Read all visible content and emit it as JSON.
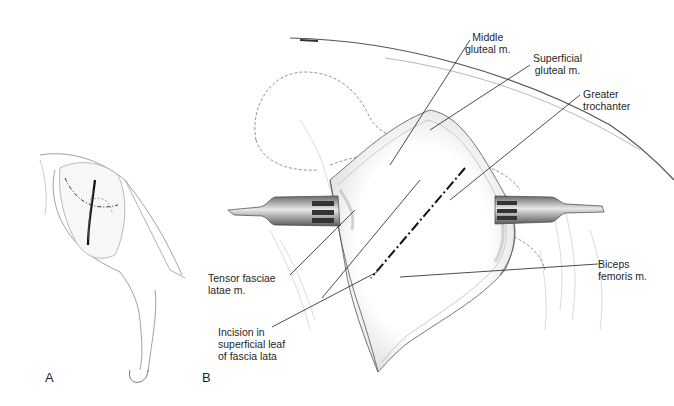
{
  "figure": {
    "panels": [
      {
        "id": "A",
        "letter": "A",
        "description": "Lateral view of canine pelvic limb showing skin incision over hip"
      },
      {
        "id": "B",
        "letter": "B",
        "description": "Exposure with retractors showing muscles and fascia incision"
      }
    ],
    "labels": {
      "middle_gluteal": {
        "line1": "Middle",
        "line2": "gluteal m."
      },
      "superficial_gluteal": {
        "line1": "Superficial",
        "line2": "gluteal m."
      },
      "greater_trochanter": {
        "line1": "Greater",
        "line2": "trochanter"
      },
      "tensor_fasciae": {
        "line1": "Tensor fasciae",
        "line2": "latae m."
      },
      "incision": {
        "line1": "Incision in",
        "line2": "superficial leaf",
        "line3": "of fascia lata"
      },
      "biceps": {
        "line1": "Biceps",
        "line2": "femoris m."
      }
    },
    "colors": {
      "ink": "#1f1f1f",
      "shade": "#9a9a9a",
      "light": "#cfcfcf",
      "background": "#ffffff"
    }
  }
}
